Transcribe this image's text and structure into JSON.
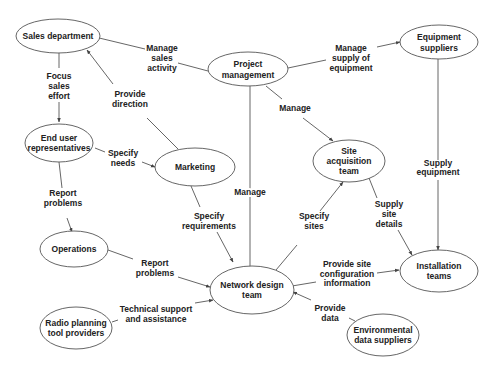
{
  "nodes": {
    "sales_department": {
      "lines": [
        "Sales department"
      ]
    },
    "project_management": {
      "lines": [
        "Project",
        "management"
      ]
    },
    "equipment_suppliers": {
      "lines": [
        "Equipment",
        "suppliers"
      ]
    },
    "end_user_representatives": {
      "lines": [
        "End user",
        "representatives"
      ]
    },
    "marketing": {
      "lines": [
        "Marketing"
      ]
    },
    "site_acquisition_team": {
      "lines": [
        "Site",
        "acquisition",
        "team"
      ]
    },
    "operations": {
      "lines": [
        "Operations"
      ]
    },
    "network_design_team": {
      "lines": [
        "Network design",
        "team"
      ]
    },
    "installation_teams": {
      "lines": [
        "Installation",
        "teams"
      ]
    },
    "radio_planning_tool_providers": {
      "lines": [
        "Radio planning",
        "tool providers"
      ]
    },
    "environmental_data_suppliers": {
      "lines": [
        "Environmental",
        "data suppliers"
      ]
    }
  },
  "edges": {
    "manage_sales_activity": {
      "from": "Project management",
      "to": "Sales department",
      "lines": [
        "Manage",
        "sales",
        "activity"
      ]
    },
    "manage_supply_of_equipment": {
      "from": "Project management",
      "to": "Equipment suppliers",
      "lines": [
        "Manage",
        "supply of",
        "equipment"
      ]
    },
    "focus_sales_effort": {
      "from": "Sales department",
      "to": "End user representatives",
      "lines": [
        "Focus",
        "sales",
        "effort"
      ]
    },
    "provide_direction": {
      "from": "Marketing",
      "to": "Sales department",
      "lines": [
        "Provide",
        "direction"
      ]
    },
    "manage_site": {
      "from": "Project management",
      "to": "Site acquisition team",
      "lines": [
        "Manage"
      ]
    },
    "manage_network": {
      "from": "Project management",
      "to": "Network design team",
      "lines": [
        "Manage"
      ]
    },
    "specify_needs": {
      "from": "End user representatives",
      "to": "Marketing",
      "lines": [
        "Specify",
        "needs"
      ]
    },
    "report_problems_1": {
      "from": "End user representatives",
      "to": "Operations",
      "lines": [
        "Report",
        "problems"
      ]
    },
    "supply_equipment": {
      "from": "Equipment suppliers",
      "to": "Installation teams",
      "lines": [
        "Supply",
        "equipment"
      ]
    },
    "specify_requirements": {
      "from": "Marketing",
      "to": "Network design team",
      "lines": [
        "Specify",
        "requirements"
      ]
    },
    "specify_sites": {
      "from": "Network design team",
      "to": "Site acquisition team",
      "lines": [
        "Specify",
        "sites"
      ]
    },
    "supply_site_details": {
      "from": "Site acquisition team",
      "to": "Installation teams",
      "lines": [
        "Supply",
        "site",
        "details"
      ]
    },
    "report_problems_2": {
      "from": "Operations",
      "to": "Network design team",
      "lines": [
        "Report",
        "problems"
      ]
    },
    "provide_site_config": {
      "from": "Network design team",
      "to": "Installation teams",
      "lines": [
        "Provide site",
        "configuration",
        "information"
      ]
    },
    "technical_support": {
      "from": "Radio planning tool providers",
      "to": "Network design team",
      "lines": [
        "Technical support",
        "and assistance"
      ]
    },
    "provide_data": {
      "from": "Environmental data suppliers",
      "to": "Network design team",
      "lines": [
        "Provide",
        "data"
      ]
    }
  },
  "colors": {
    "stroke": "#555555",
    "text": "#222222",
    "background": "#ffffff"
  }
}
